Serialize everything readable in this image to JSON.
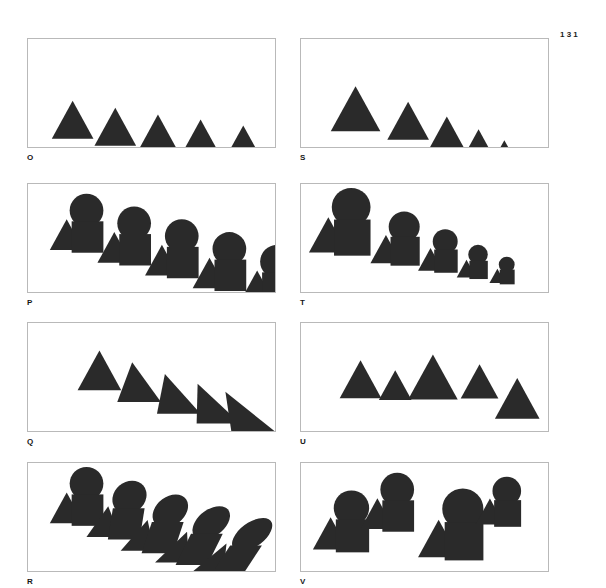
{
  "page": {
    "number": "131",
    "width": 606,
    "height": 588,
    "background_color": "#ffffff",
    "shape_color": "#2a2a2a",
    "panel_border_color": "#b9b9b9"
  },
  "panels": [
    {
      "id": "O",
      "label": "O",
      "x": 27,
      "y": 38,
      "w": 249,
      "h": 110,
      "label_x": 27,
      "label_y": 153,
      "description": "Five identical equilateral triangles in a row, each stepped slightly downward to the right (constant size, constant spacing, gradual vertical descent).",
      "figure": {
        "type": "shape-series",
        "transform": "translation-step",
        "group": [
          "triangle"
        ],
        "count": 5,
        "shapes": [
          {
            "kind": "triangle",
            "cx": 45,
            "cy": 63,
            "size": 42
          },
          {
            "kind": "triangle",
            "cx": 88,
            "cy": 70,
            "size": 42
          },
          {
            "kind": "triangle",
            "cx": 131,
            "cy": 77,
            "size": 42
          },
          {
            "kind": "triangle",
            "cx": 174,
            "cy": 82,
            "size": 42
          },
          {
            "kind": "triangle",
            "cx": 217,
            "cy": 88,
            "size": 42
          }
        ]
      }
    },
    {
      "id": "S",
      "label": "S",
      "x": 300,
      "y": 38,
      "w": 249,
      "h": 110,
      "label_x": 300,
      "label_y": 153,
      "description": "Five equilateral triangles descending diagonally and shrinking progressively in size (scaling plus translation).",
      "figure": {
        "type": "shape-series",
        "transform": "scale-and-translate",
        "group": [
          "triangle"
        ],
        "count": 5,
        "shapes": [
          {
            "kind": "triangle",
            "cx": 55,
            "cy": 48,
            "size": 50
          },
          {
            "kind": "triangle",
            "cx": 108,
            "cy": 64,
            "size": 42
          },
          {
            "kind": "triangle",
            "cx": 147,
            "cy": 79,
            "size": 35
          },
          {
            "kind": "triangle",
            "cx": 179,
            "cy": 92,
            "size": 28
          },
          {
            "kind": "triangle",
            "cx": 205,
            "cy": 103,
            "size": 22
          }
        ]
      }
    },
    {
      "id": "P",
      "label": "P",
      "x": 27,
      "y": 183,
      "w": 249,
      "h": 110,
      "label_x": 27,
      "label_y": 298,
      "description": "Five identical triangle-circle-square groups repeating and stepping down to the right at constant size.",
      "figure": {
        "type": "group-series",
        "transform": "translation-step",
        "group": [
          "triangle",
          "circle",
          "square"
        ],
        "count": 5,
        "groups": [
          {
            "tx": 22,
            "ty": 10,
            "scale": 1.0
          },
          {
            "tx": 70,
            "ty": 23,
            "scale": 1.0
          },
          {
            "tx": 118,
            "ty": 36,
            "scale": 1.0
          },
          {
            "tx": 166,
            "ty": 49,
            "scale": 1.0
          },
          {
            "tx": 214,
            "ty": 62,
            "scale": 1.0
          }
        ]
      }
    },
    {
      "id": "T",
      "label": "T",
      "x": 300,
      "y": 183,
      "w": 249,
      "h": 110,
      "label_x": 300,
      "label_y": 298,
      "description": "Five triangle-circle-square groups descending diagonally while progressively shrinking in scale.",
      "figure": {
        "type": "group-series",
        "transform": "scale-and-translate",
        "group": [
          "triangle",
          "circle",
          "square"
        ],
        "count": 5,
        "groups": [
          {
            "tx": 8,
            "ty": 4,
            "scale": 1.15
          },
          {
            "tx": 70,
            "ty": 28,
            "scale": 0.92
          },
          {
            "tx": 118,
            "ty": 46,
            "scale": 0.74
          },
          {
            "tx": 157,
            "ty": 62,
            "scale": 0.58
          },
          {
            "tx": 190,
            "ty": 74,
            "scale": 0.47
          }
        ]
      }
    },
    {
      "id": "Q",
      "label": "Q",
      "x": 27,
      "y": 322,
      "w": 249,
      "h": 110,
      "label_x": 27,
      "label_y": 437,
      "description": "Five same-size triangles stepping down to the right, each progressively sheared so the apex leans further left, turning the last into a right triangle.",
      "figure": {
        "type": "shape-series",
        "transform": "progressive-shear",
        "group": [
          "triangle"
        ],
        "count": 5,
        "shapes": [
          {
            "kind": "triangle",
            "cx": 72,
            "cy": 28,
            "size": 44,
            "skew": 0
          },
          {
            "kind": "triangle",
            "cx": 112,
            "cy": 40,
            "size": 44,
            "skew": -7
          },
          {
            "kind": "triangle",
            "cx": 152,
            "cy": 52,
            "size": 44,
            "skew": -14
          },
          {
            "kind": "triangle",
            "cx": 192,
            "cy": 62,
            "size": 44,
            "skew": -21
          },
          {
            "kind": "triangle",
            "cx": 227,
            "cy": 70,
            "size": 44,
            "skew": -28
          }
        ]
      }
    },
    {
      "id": "U",
      "label": "U",
      "x": 300,
      "y": 322,
      "w": 249,
      "h": 110,
      "label_x": 300,
      "label_y": 437,
      "description": "Five triangles of irregular sizes at irregular vertical offsets — no consistent progression (random variation).",
      "figure": {
        "type": "shape-series",
        "transform": "irregular",
        "group": [
          "triangle"
        ],
        "count": 5,
        "shapes": [
          {
            "kind": "triangle",
            "cx": 60,
            "cy": 38,
            "size": 42
          },
          {
            "kind": "triangle",
            "cx": 95,
            "cy": 48,
            "size": 33
          },
          {
            "kind": "triangle",
            "cx": 133,
            "cy": 32,
            "size": 50
          },
          {
            "kind": "triangle",
            "cx": 180,
            "cy": 42,
            "size": 38
          },
          {
            "kind": "triangle",
            "cx": 218,
            "cy": 56,
            "size": 45
          }
        ]
      }
    },
    {
      "id": "R",
      "label": "R",
      "x": 27,
      "y": 462,
      "w": 249,
      "h": 110,
      "label_x": 27,
      "label_y": 577,
      "description": "Five triangle-circle-square groups stepping down to the right, each progressively sheared so circles become slanted ellipses and squares become parallelograms.",
      "figure": {
        "type": "group-series",
        "transform": "progressive-shear",
        "group": [
          "triangle",
          "circle",
          "square"
        ],
        "count": 5,
        "groups": [
          {
            "tx": 22,
            "ty": 4,
            "scale": 1.0,
            "skew": 0
          },
          {
            "tx": 68,
            "ty": 18,
            "scale": 1.0,
            "skew": -9
          },
          {
            "tx": 112,
            "ty": 32,
            "scale": 1.0,
            "skew": -18
          },
          {
            "tx": 156,
            "ty": 44,
            "scale": 1.0,
            "skew": -26
          },
          {
            "tx": 200,
            "ty": 56,
            "scale": 1.0,
            "skew": -33
          }
        ]
      }
    },
    {
      "id": "V",
      "label": "V",
      "x": 300,
      "y": 462,
      "w": 249,
      "h": 110,
      "label_x": 300,
      "label_y": 577,
      "description": "Four triangle-circle-square groups of irregular sizes scattered at irregular positions — no consistent progression (random variation).",
      "figure": {
        "type": "group-series",
        "transform": "irregular",
        "group": [
          "triangle",
          "circle",
          "square"
        ],
        "count": 4,
        "groups": [
          {
            "tx": 12,
            "ty": 28,
            "scale": 1.05
          },
          {
            "tx": 60,
            "ty": 10,
            "scale": 1.0
          },
          {
            "tx": 118,
            "ty": 26,
            "scale": 1.22
          },
          {
            "tx": 176,
            "ty": 14,
            "scale": 0.85
          }
        ]
      }
    }
  ]
}
